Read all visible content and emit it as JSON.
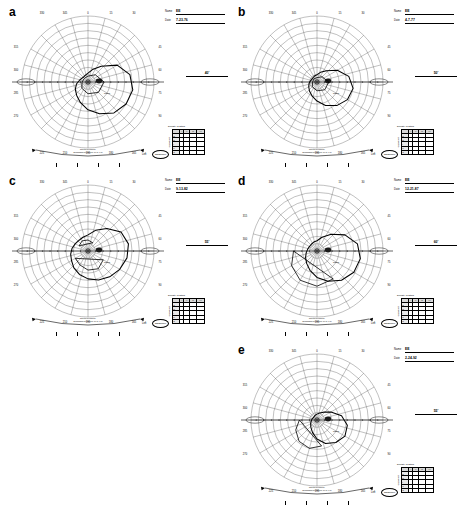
{
  "figure": {
    "type": "multi-panel-figure",
    "panel_count": 5,
    "background": "#ffffff",
    "ink": "#000000"
  },
  "common": {
    "name_label": "Name",
    "date_label": "Date",
    "eye_label": "Left",
    "stamp_text": "Goldmann",
    "density_title": "Density of Stars",
    "density_side_label": "Quadrant",
    "density_columns": [
      "",
      "I",
      "II",
      "III",
      "IV"
    ],
    "density_rows": [
      {
        "label": "S",
        "cells": [
          "",
          "",
          "",
          ""
        ]
      },
      {
        "label": "N",
        "cells": [
          "",
          "",
          "",
          ""
        ]
      },
      {
        "label": "I",
        "cells": [
          "",
          "",
          "",
          ""
        ]
      },
      {
        "label": "T",
        "cells": [
          "",
          "",
          "",
          ""
        ]
      },
      {
        "label": "C",
        "cells": [
          "",
          "",
          "",
          ""
        ]
      }
    ],
    "caption_line1": "kinetic perimetry",
    "caption_line2": "Goldmann perimeter  III/4e  I/4e",
    "meridian_labels_top": [
      "330",
      "345",
      "0",
      "15",
      "30"
    ],
    "meridian_labels_left": [
      "315",
      "300",
      "285",
      "270"
    ],
    "meridian_labels_right": [
      "45",
      "60",
      "75",
      "90"
    ],
    "meridian_labels_bottom": [
      "225",
      "210",
      "195",
      "180",
      "165"
    ],
    "radial_rings_deg": [
      10,
      20,
      30,
      40,
      50,
      60,
      70,
      80,
      90
    ],
    "blind_spot_present": true
  },
  "panels": [
    {
      "letter": "a",
      "name": "EE",
      "date": "7-23-76",
      "acuity": "40'",
      "isopter_note": "Nasal",
      "field_shape": "large-inferotemporal-defect"
    },
    {
      "letter": "b",
      "name": "EE",
      "date": "4-7-77",
      "acuity": "50'",
      "isopter_note": "Nasal",
      "field_shape": "constricted-irregular"
    },
    {
      "letter": "c",
      "name": "EE",
      "date": "9-13-82",
      "acuity": "55'",
      "isopter_note": "Nasal",
      "field_shape": "multiple-islands-scotoma"
    },
    {
      "letter": "d",
      "name": "EE",
      "date": "12-21-87",
      "acuity": "60'",
      "isopter_note": "Nasal",
      "field_shape": "arcuate-inferior-defect"
    },
    {
      "letter": "e",
      "name": "EE",
      "date": "2-24-92",
      "acuity": "55'",
      "isopter_note": "Nasal",
      "field_shape": "narrow-inferior-crescent"
    }
  ],
  "chart_data": {
    "type": "line",
    "subtitle": "Isopter contours plotted on polar visual-field grid",
    "xlabel": "Meridian (degrees)",
    "ylabel": "Eccentricity (degrees)",
    "grid": true,
    "legend_position": "none",
    "polar": {
      "radial_ticks": [
        10,
        20,
        30,
        40,
        50,
        60,
        70,
        80,
        90
      ],
      "angular_ticks": [
        0,
        15,
        30,
        45,
        60,
        75,
        90,
        105,
        120,
        135,
        150,
        165,
        180,
        195,
        210,
        225,
        240,
        255,
        270,
        285,
        300,
        315,
        330,
        345
      ],
      "rlim": [
        0,
        90
      ]
    },
    "series": [
      {
        "name": "a (7-23-76)",
        "panel": "a",
        "isopters": [
          {
            "label": "outer isopter",
            "theta_deg": [
              0,
              20,
              40,
              60,
              80,
              100,
              120,
              140,
              160,
              180,
              200,
              220,
              240,
              260,
              280,
              300,
              320,
              340
            ],
            "r_deg": [
              12,
              18,
              28,
              46,
              58,
              62,
              60,
              55,
              46,
              38,
              30,
              24,
              20,
              16,
              12,
              10,
              9,
              10
            ]
          },
          {
            "label": "inner isopter",
            "theta_deg": [
              0,
              45,
              90,
              135,
              180,
              225,
              270,
              315
            ],
            "r_deg": [
              8,
              14,
              22,
              20,
              16,
              12,
              8,
              7
            ]
          }
        ]
      },
      {
        "name": "b (4-7-77)",
        "panel": "b",
        "isopters": [
          {
            "label": "outer isopter",
            "theta_deg": [
              0,
              20,
              40,
              60,
              80,
              100,
              120,
              140,
              160,
              180,
              200,
              220,
              240,
              260,
              280,
              300,
              320,
              340
            ],
            "r_deg": [
              10,
              14,
              20,
              32,
              44,
              50,
              48,
              42,
              34,
              26,
              20,
              16,
              13,
              11,
              9,
              8,
              8,
              9
            ]
          },
          {
            "label": "inner isopter",
            "theta_deg": [
              0,
              45,
              90,
              135,
              180,
              225,
              270,
              315
            ],
            "r_deg": [
              6,
              10,
              16,
              15,
              12,
              9,
              6,
              6
            ]
          }
        ]
      },
      {
        "name": "c (9-13-82)",
        "panel": "c",
        "isopters": [
          {
            "label": "outer isopter",
            "theta_deg": [
              0,
              20,
              40,
              60,
              80,
              100,
              120,
              140,
              160,
              180,
              200,
              220,
              240,
              260,
              280,
              300,
              320,
              340
            ],
            "r_deg": [
              22,
              30,
              40,
              52,
              56,
              54,
              50,
              46,
              42,
              38,
              34,
              30,
              26,
              24,
              22,
              20,
              19,
              20
            ]
          },
          {
            "label": "scotoma island 1",
            "theta_deg": [
              120,
              150,
              180,
              210,
              240
            ],
            "r_deg": [
              24,
              28,
              26,
              22,
              20
            ]
          },
          {
            "label": "scotoma island 2",
            "theta_deg": [
              300,
              330,
              0,
              30
            ],
            "r_deg": [
              14,
              16,
              15,
              13
            ]
          }
        ]
      },
      {
        "name": "d (12-21-87)",
        "panel": "d",
        "isopters": [
          {
            "label": "outer isopter",
            "theta_deg": [
              0,
              20,
              40,
              60,
              80,
              100,
              120,
              140,
              160,
              180,
              200,
              220,
              240,
              260,
              280,
              300,
              320,
              340
            ],
            "r_deg": [
              14,
              20,
              30,
              44,
              56,
              60,
              58,
              52,
              44,
              36,
              28,
              22,
              18,
              15,
              13,
              12,
              12,
              13
            ]
          },
          {
            "label": "arcuate defect border",
            "theta_deg": [
              150,
              180,
              210,
              240,
              270
            ],
            "r_deg": [
              44,
              48,
              46,
              40,
              32
            ]
          }
        ]
      },
      {
        "name": "e (2-24-92)",
        "panel": "e",
        "isopters": [
          {
            "label": "outer isopter",
            "theta_deg": [
              0,
              20,
              40,
              60,
              80,
              100,
              120,
              140,
              160,
              180,
              200,
              220,
              240,
              260,
              280,
              300,
              320,
              340
            ],
            "r_deg": [
              8,
              10,
              14,
              22,
              34,
              42,
              44,
              40,
              34,
              26,
              18,
              13,
              10,
              8,
              7,
              6,
              6,
              7
            ]
          },
          {
            "label": "inferior crescent",
            "theta_deg": [
              170,
              195,
              220,
              245,
              270
            ],
            "r_deg": [
              36,
              40,
              38,
              32,
              24
            ]
          }
        ]
      }
    ]
  }
}
